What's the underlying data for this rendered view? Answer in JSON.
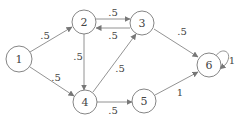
{
  "diagram": {
    "type": "directed-graph",
    "colors": {
      "stroke": "#777777",
      "text": "#444444",
      "background": "#ffffff"
    },
    "nodes": [
      {
        "id": "1",
        "label": "1",
        "x": 19,
        "y": 59,
        "r": 13
      },
      {
        "id": "2",
        "label": "2",
        "x": 84,
        "y": 22,
        "r": 12
      },
      {
        "id": "3",
        "label": "3",
        "x": 142,
        "y": 23,
        "r": 12
      },
      {
        "id": "4",
        "label": "4",
        "x": 85,
        "y": 102,
        "r": 12
      },
      {
        "id": "5",
        "label": "5",
        "x": 144,
        "y": 101,
        "r": 12
      },
      {
        "id": "6",
        "label": "6",
        "x": 209,
        "y": 65,
        "r": 12
      }
    ],
    "edges": [
      {
        "from": "1",
        "to": "2",
        "label": ".5"
      },
      {
        "from": "1",
        "to": "4",
        "label": ".5"
      },
      {
        "from": "2",
        "to": "3",
        "label": ".5"
      },
      {
        "from": "3",
        "to": "2",
        "label": ".5"
      },
      {
        "from": "2",
        "to": "4",
        "label": ".5"
      },
      {
        "from": "4",
        "to": "3",
        "label": ".5"
      },
      {
        "from": "4",
        "to": "5",
        "label": ".5"
      },
      {
        "from": "3",
        "to": "6",
        "label": ".5"
      },
      {
        "from": "5",
        "to": "6",
        "label": "1"
      },
      {
        "from": "6",
        "to": "6",
        "label": "1"
      }
    ]
  }
}
